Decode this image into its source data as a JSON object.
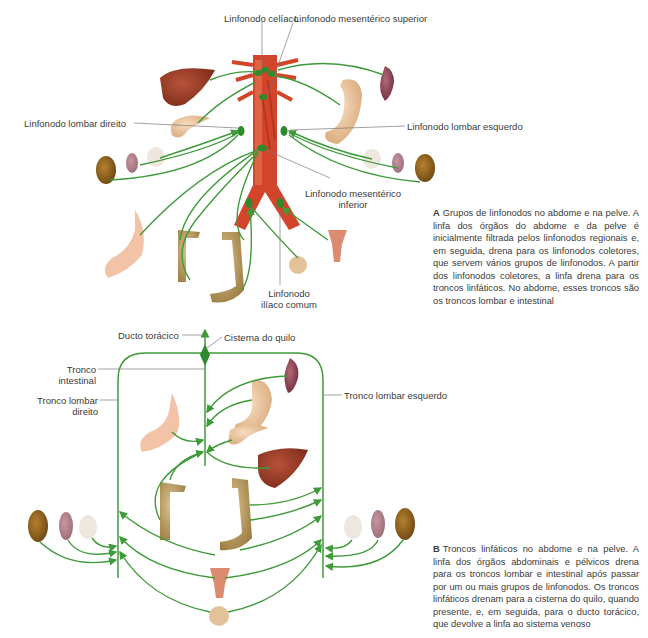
{
  "panel_a": {
    "labels": {
      "celiac": "Linfonodo celíaco",
      "sup_mesenteric": "Linfonodo mesentérico superior",
      "lumbar_right": "Linfonodo lombar direito",
      "lumbar_left": "Linfonodo lombar esquerdo",
      "inf_mesenteric_1": "Linfonodo mesentérico",
      "inf_mesenteric_2": "inferior",
      "iliac_1": "Linfonodo",
      "iliac_2": "ilíaco comum"
    },
    "caption": {
      "letter": "A",
      "text": "Grupos de linfonodos no abdome e na pelve. A linfa dos órgãos do abdome e da pelve é inicialmente filtrada pelos linfonodos regionais e, em seguida, drena para os linfonodos coletores, que servem vários grupos de linfonodos. A partir dos linfonodos coletores, a linfa drena para os troncos linfáticos. No abdome, esses troncos são os troncos lombar e intestinal"
    }
  },
  "panel_b": {
    "labels": {
      "thoracic_duct": "Ducto torácico",
      "cisterna": "Cisterna do quilo",
      "intestinal_1": "Tronco",
      "intestinal_2": "intestinal",
      "lumbar_right_1": "Tronco lombar",
      "lumbar_right_2": "direito",
      "lumbar_left": "Tronco lombar esquerdo"
    },
    "caption": {
      "letter": "B",
      "text": "Troncos linfáticos no abdome e na pelve. A linfa dos órgãos abdominais e pélvicos drena para os troncos lombar e intestinal após passar por um ou mais grupos de linfonodos. Os troncos linfáticos drenam para a cisterna do quilo, quando presente, e, em seguida, para o ducto torácico, que devolve a linfa ao sistema venoso"
    }
  },
  "colors": {
    "lymph_green": "#3f9a3a",
    "node_green": "#2f8a2e",
    "aorta_red": "#d2452a",
    "leader_gray": "#7a7a7a"
  }
}
